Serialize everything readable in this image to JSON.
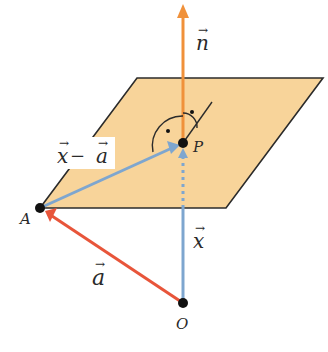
{
  "diagram": {
    "type": "vector-plane-normal",
    "colors": {
      "plane_fill": "#f8d49a",
      "plane_edge": "#2b2b2b",
      "normal_vector": "#f0913a",
      "vector_a": "#e8553a",
      "vector_x": "#7ea6cf",
      "vector_x_minus_a": "#7ea6cf",
      "point": "#111111"
    },
    "points": {
      "A": {
        "label": "A"
      },
      "P": {
        "label": "P"
      },
      "O": {
        "label": "O"
      }
    },
    "vectors": {
      "n": {
        "base": "n",
        "label": "n⃗"
      },
      "a": {
        "base": "a",
        "label": "a⃗"
      },
      "x": {
        "base": "x",
        "label": "x⃗"
      },
      "x_minus_a": {
        "left": "x",
        "op": " − ",
        "right": "a"
      }
    }
  }
}
